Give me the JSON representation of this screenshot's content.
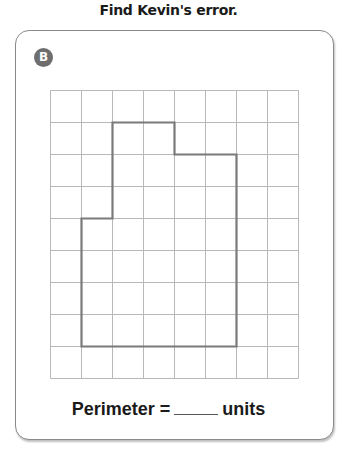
{
  "title": "Find Kevin's error.",
  "card": {
    "badge": "B",
    "grid": {
      "columns": 8,
      "rows": 9,
      "cell_px": 31.8
    },
    "shape_vertices_grid_units": [
      [
        2,
        1
      ],
      [
        4,
        1
      ],
      [
        4,
        2
      ],
      [
        6,
        2
      ],
      [
        6,
        8
      ],
      [
        1,
        8
      ],
      [
        1,
        4
      ],
      [
        2,
        4
      ]
    ],
    "perimeter_label": "Perimeter =",
    "perimeter_value": "",
    "units_label": "units"
  },
  "colors": {
    "grid_line": "#b8b8b8",
    "shape_outline": "#7a7a7a",
    "badge": "#6e6e6e"
  }
}
